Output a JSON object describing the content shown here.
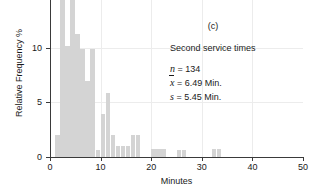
{
  "chart_data": {
    "type": "bar",
    "title": "",
    "panel_label": "(c)",
    "xlabel": "Minutes",
    "ylabel": "Relative Frequency %",
    "xlim": [
      0,
      50
    ],
    "ylim": [
      0,
      14.4
    ],
    "grid": true,
    "bin_width": 1,
    "xticks": [
      0,
      10,
      20,
      30,
      40,
      50
    ],
    "yticks": [
      0,
      5,
      10
    ],
    "bar_color": "#d4d4d4",
    "note": "Histogram of second service times; two tallest bars are clipped by the top of the figure.",
    "bins": [
      {
        "x": 1,
        "value": 2.0
      },
      {
        "x": 2,
        "value": 14.4
      },
      {
        "x": 3,
        "value": 10.2
      },
      {
        "x": 4,
        "value": 14.4
      },
      {
        "x": 5,
        "value": 11.3
      },
      {
        "x": 6,
        "value": 9.9
      },
      {
        "x": 7,
        "value": 7.0
      },
      {
        "x": 8,
        "value": 9.9
      },
      {
        "x": 9,
        "value": 0.6
      },
      {
        "x": 10,
        "value": 3.9
      },
      {
        "x": 11,
        "value": 5.9
      },
      {
        "x": 12,
        "value": 2.0
      },
      {
        "x": 13,
        "value": 1.0
      },
      {
        "x": 14,
        "value": 1.0
      },
      {
        "x": 15,
        "value": 1.0
      },
      {
        "x": 16,
        "value": 2.0
      },
      {
        "x": 17,
        "value": 2.0
      },
      {
        "x": 20,
        "value": 0.7
      },
      {
        "x": 21,
        "value": 0.7
      },
      {
        "x": 22,
        "value": 0.7
      },
      {
        "x": 25,
        "value": 0.6
      },
      {
        "x": 26,
        "value": 0.6
      },
      {
        "x": 32,
        "value": 0.7
      },
      {
        "x": 33,
        "value": 0.7
      }
    ],
    "annotation": {
      "title": "Second service times",
      "stats": [
        {
          "symbol": "n",
          "symbol_type": "plain",
          "text": " = 134"
        },
        {
          "symbol": "x",
          "symbol_type": "overbar",
          "text": " = 6.49 Min."
        },
        {
          "symbol": "s",
          "symbol_type": "plain",
          "text": " = 5.45 Min."
        }
      ]
    }
  }
}
